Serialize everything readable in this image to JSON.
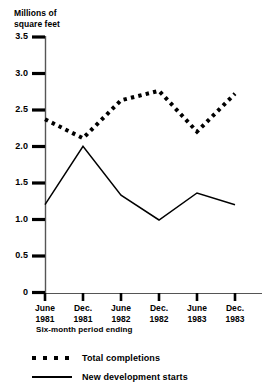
{
  "chart_data": {
    "type": "line",
    "title": "",
    "xlabel": "Six-month period ending",
    "ylabel": "Millions of\nsquare feet",
    "categories": [
      "June\n1981",
      "Dec.\n1981",
      "June\n1982",
      "Dec.\n1982",
      "June\n1983",
      "Dec.\n1983"
    ],
    "ylim": [
      0,
      3.5
    ],
    "yticks": [
      "0",
      "0.5",
      "1.0",
      "1.5",
      "2.0",
      "2.5",
      "3.0",
      "3.5"
    ],
    "ytick_values": [
      0,
      0.5,
      1.0,
      1.5,
      2.0,
      2.5,
      3.0,
      3.5
    ],
    "grid": false,
    "legend_position": "bottom-left",
    "series": [
      {
        "name": "Total completions",
        "style": "dotted",
        "color": "#000000",
        "values": [
          2.38,
          2.12,
          2.64,
          2.77,
          2.21,
          2.73
        ]
      },
      {
        "name": "New development starts",
        "style": "solid",
        "color": "#000000",
        "values": [
          1.21,
          2.01,
          1.34,
          1.0,
          1.37,
          1.21
        ]
      }
    ]
  },
  "legend": {
    "items": [
      {
        "label": "Total completions",
        "style": "dotted"
      },
      {
        "label": "New development starts",
        "style": "solid"
      }
    ]
  },
  "axes": {
    "y_title": "Millions of\nsquare feet",
    "x_title": "Six-month period ending"
  }
}
